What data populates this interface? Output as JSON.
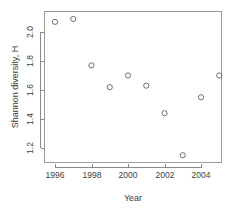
{
  "chart_data": {
    "type": "scatter",
    "title": "",
    "xlabel": "Year",
    "ylabel": "Shannon diversity, H",
    "x": [
      1996,
      1997,
      1998,
      1999,
      2000,
      2001,
      2002,
      2003,
      2004,
      2005
    ],
    "values": [
      2.07,
      2.09,
      1.77,
      1.62,
      1.7,
      1.63,
      1.44,
      1.15,
      1.55,
      1.7
    ],
    "series": [
      {
        "name": "Shannon diversity, H",
        "values": [
          2.07,
          2.09,
          1.77,
          1.62,
          1.7,
          1.63,
          1.44,
          1.15,
          1.55,
          1.7
        ]
      }
    ],
    "xlim": [
      1995.5,
      2005.6
    ],
    "ylim": [
      1.12,
      2.13
    ],
    "xticks": [
      1996,
      1998,
      2000,
      2002,
      2004
    ],
    "xtick_labels": [
      "1996",
      "1998",
      "2000",
      "2002",
      "2004"
    ],
    "yticks": [
      1.2,
      1.4,
      1.6,
      1.8,
      2.0
    ],
    "ytick_labels": [
      "1.2",
      "1.4",
      "1.6",
      "1.8",
      "2.0"
    ],
    "grid": false,
    "legend": false,
    "legend_position": "none",
    "marker": "open-circle",
    "marker_color": "#6f6f6f",
    "axis_color": "#8a8a8a",
    "text_color": "#3d3d3d",
    "background": "#ffffff"
  }
}
